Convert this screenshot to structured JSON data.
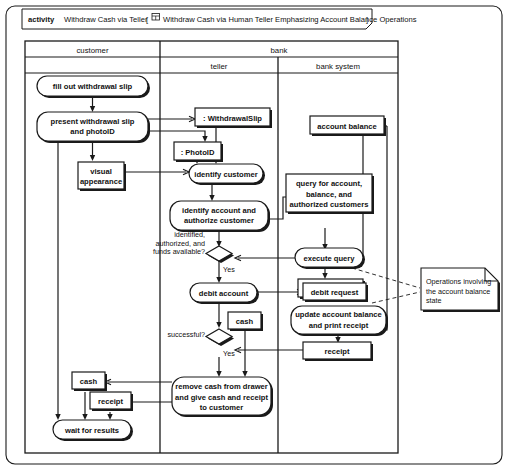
{
  "frame": {
    "keyword": "activity",
    "name": "Withdraw Cash via Teller",
    "bracket_open": "[",
    "diagram_icon": "diagram-frame-icon",
    "diagram_title": "Withdraw Cash via Human Teller Emphasizing Account Balance Operations",
    "bracket_close": "]"
  },
  "swimlanes": {
    "group_label": "bank",
    "lanes": [
      {
        "id": "customer",
        "label": "customer"
      },
      {
        "id": "teller",
        "label": "teller"
      },
      {
        "id": "bank-system",
        "label": "bank system"
      }
    ]
  },
  "nodes": {
    "fill_out_slip": "fill out withdrawal slip",
    "present_slip": [
      "present withdrawal slip",
      "and photoID"
    ],
    "visual_appearance": [
      "visual",
      "appearance"
    ],
    "withdrawal_slip_obj": ": WithdrawalSlip",
    "photo_id_obj": ": PhotoID",
    "identify_customer": "identify customer",
    "identify_account": [
      "identify account and",
      "authorize customer"
    ],
    "account_balance_obj": "account balance",
    "query_for_account": [
      "query for account,",
      "balance, and",
      "authorized customers"
    ],
    "execute_query": "execute query",
    "query_results_obj": "query results",
    "debit_account": "debit account",
    "debit_request_obj": "debit request",
    "cash_teller_obj": "cash",
    "update_balance": [
      "update account balance",
      "and print receipt"
    ],
    "receipt_sys_obj": "receipt",
    "remove_cash": [
      "remove cash from drawer",
      "and give cash and receipt",
      "to customer"
    ],
    "cash_customer_obj": "cash",
    "receipt_customer_obj": "receipt",
    "wait_for_results": "wait for results"
  },
  "edge_labels": {
    "guard_identified": [
      "identified,",
      "authorized, and",
      "funds available?"
    ],
    "yes_1": "Yes",
    "guard_successful": "successful?",
    "yes_2": "Yes"
  },
  "note": {
    "lines": [
      "Operations involving",
      "the account balance",
      "state"
    ]
  },
  "colors": {
    "stroke": "#1a1a1a",
    "fill": "#ffffff",
    "shadow": "#1a1a1a",
    "text": "#111111"
  }
}
